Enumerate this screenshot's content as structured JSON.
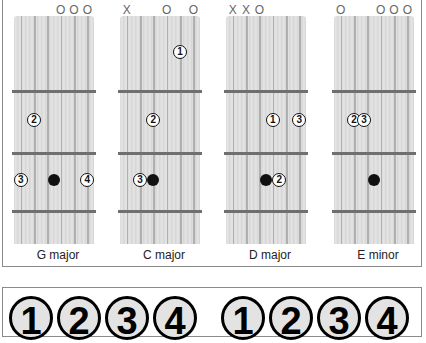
{
  "chords": [
    {
      "name": "G major",
      "markers": [
        {
          "string": 3,
          "symbol": "O"
        },
        {
          "string": 4,
          "symbol": "O"
        },
        {
          "string": 5,
          "symbol": "O"
        }
      ],
      "fingers": [
        {
          "num": "2",
          "string": 1,
          "fret": 2
        },
        {
          "num": "3",
          "string": 0,
          "fret": 3
        },
        {
          "num": "4",
          "string": 5,
          "fret": 3
        }
      ],
      "dots": [
        {
          "string": 2.5,
          "fret": 3
        }
      ]
    },
    {
      "name": "C major",
      "markers": [
        {
          "string": 0,
          "symbol": "X"
        },
        {
          "string": 3,
          "symbol": "O"
        },
        {
          "string": 5,
          "symbol": "O"
        }
      ],
      "fingers": [
        {
          "num": "1",
          "string": 4,
          "fret": 1
        },
        {
          "num": "2",
          "string": 2,
          "fret": 2
        },
        {
          "num": "3",
          "string": 1,
          "fret": 3
        }
      ],
      "dots": [
        {
          "string": 2,
          "fret": 3
        }
      ]
    },
    {
      "name": "D major",
      "markers": [
        {
          "string": 0,
          "symbol": "X"
        },
        {
          "string": 1,
          "symbol": "X"
        },
        {
          "string": 2,
          "symbol": "O"
        }
      ],
      "fingers": [
        {
          "num": "1",
          "string": 3,
          "fret": 2
        },
        {
          "num": "3",
          "string": 5,
          "fret": 2
        },
        {
          "num": "2",
          "string": 3.5,
          "fret": 3
        }
      ],
      "dots": [
        {
          "string": 2.5,
          "fret": 3
        }
      ]
    },
    {
      "name": "E minor",
      "markers": [
        {
          "string": 0,
          "symbol": "O"
        },
        {
          "string": 3,
          "symbol": "O"
        },
        {
          "string": 4,
          "symbol": "O"
        },
        {
          "string": 5,
          "symbol": "O"
        }
      ],
      "fingers": [
        {
          "num": "2",
          "string": 1,
          "fret": 2
        },
        {
          "num": "3",
          "string": 1.75,
          "fret": 2
        }
      ],
      "dots": [
        {
          "string": 2.5,
          "fret": 3
        }
      ]
    }
  ],
  "legend": {
    "numbers": [
      "1",
      "2",
      "3",
      "4",
      "1",
      "2",
      "3",
      "4"
    ]
  }
}
